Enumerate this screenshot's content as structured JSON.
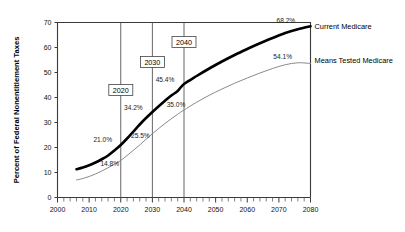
{
  "chart_data": {
    "type": "line",
    "title": "",
    "xlabel": "",
    "ylabel": "Percent of Federal Nonentitlement Taxes",
    "xlim": [
      2000,
      2080
    ],
    "ylim": [
      0,
      70
    ],
    "xticks": [
      2000,
      2010,
      2020,
      2030,
      2040,
      2050,
      2060,
      2070,
      2080
    ],
    "yticks": [
      0,
      10,
      20,
      30,
      40,
      50,
      60,
      70
    ],
    "xtick_labels": [
      "2000",
      "2010",
      "2020",
      "2030",
      "2040",
      "2050",
      "2060",
      "2070",
      "2080"
    ],
    "ytick_labels": [
      "0",
      "10",
      "20",
      "30",
      "40",
      "50",
      "60",
      "70"
    ],
    "x_minor_tick_step": 2,
    "grid": false,
    "legend_position": "right-inline",
    "series": [
      {
        "name": "Current Medicare",
        "color": "#000000",
        "style": "thick",
        "x": [
          2006,
          2008,
          2010,
          2012,
          2014,
          2016,
          2018,
          2020,
          2022,
          2024,
          2026,
          2028,
          2030,
          2032,
          2034,
          2036,
          2038,
          2040,
          2044,
          2048,
          2052,
          2056,
          2060,
          2064,
          2068,
          2072,
          2076,
          2080
        ],
        "values": [
          11.3,
          12.0,
          12.9,
          14.0,
          15.3,
          16.8,
          18.8,
          21.0,
          23.6,
          26.4,
          29.2,
          31.8,
          34.2,
          36.5,
          38.7,
          40.8,
          42.6,
          45.4,
          48.6,
          51.6,
          54.4,
          57.0,
          59.4,
          61.7,
          63.8,
          65.8,
          67.3,
          68.5
        ]
      },
      {
        "name": "Means Tested Medicare",
        "color": "#8a8a8a",
        "style": "thin",
        "x": [
          2006,
          2008,
          2010,
          2012,
          2014,
          2016,
          2018,
          2020,
          2022,
          2024,
          2026,
          2028,
          2030,
          2032,
          2034,
          2036,
          2038,
          2040,
          2044,
          2048,
          2052,
          2056,
          2060,
          2064,
          2068,
          2072,
          2076,
          2080
        ],
        "values": [
          7.0,
          7.6,
          8.4,
          9.4,
          10.6,
          11.9,
          13.3,
          14.8,
          16.8,
          18.9,
          21.0,
          23.3,
          25.5,
          27.6,
          29.6,
          31.5,
          33.3,
          35.0,
          38.1,
          40.9,
          43.4,
          45.7,
          47.8,
          49.8,
          51.6,
          53.1,
          53.9,
          53.6
        ]
      }
    ],
    "point_labels": [
      {
        "text": "21.0%",
        "series": "Current Medicare",
        "x": 2020,
        "y": 21.0
      },
      {
        "text": "34.2%",
        "series": "Current Medicare",
        "x": 2030,
        "y": 34.2
      },
      {
        "text": "45.4%",
        "series": "Current Medicare",
        "x": 2040,
        "y": 45.4
      },
      {
        "text": "68.2%",
        "series": "Current Medicare",
        "x": 2076,
        "y": 68.2
      },
      {
        "text": "14.8%",
        "series": "Means Tested Medicare",
        "x": 2020,
        "y": 14.8
      },
      {
        "text": "25.5%",
        "series": "Means Tested Medicare",
        "x": 2030,
        "y": 25.5
      },
      {
        "text": "35.0%",
        "series": "Means Tested Medicare",
        "x": 2040,
        "y": 35.0
      },
      {
        "text": "54.1%",
        "series": "Means Tested Medicare",
        "x": 2075,
        "y": 54.1
      }
    ],
    "vertical_markers": [
      {
        "label": "2020",
        "x": 2020
      },
      {
        "label": "2030",
        "x": 2030
      },
      {
        "label": "2040",
        "x": 2040
      }
    ],
    "annotations": []
  }
}
